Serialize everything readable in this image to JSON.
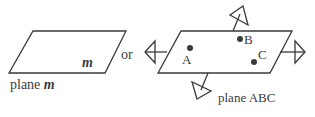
{
  "diagram": {
    "left_plane": {
      "label": "plane",
      "name": "m",
      "inner_label": "m"
    },
    "connector": "or",
    "right_plane": {
      "label": "plane ABC",
      "points": [
        {
          "name": "A"
        },
        {
          "name": "B"
        },
        {
          "name": "C"
        }
      ]
    },
    "colors": {
      "stroke": "#3a3a3a",
      "background": "#ffffff"
    }
  }
}
